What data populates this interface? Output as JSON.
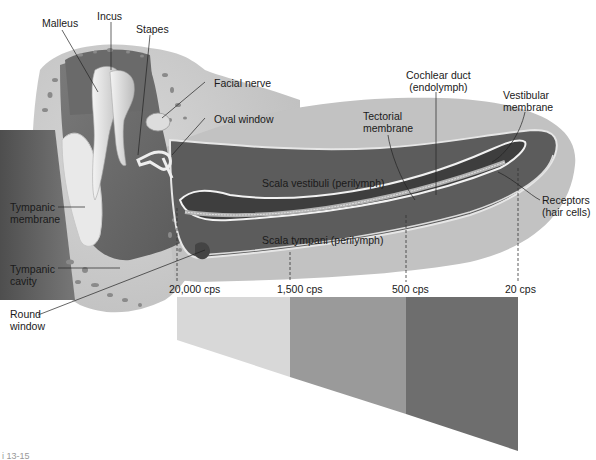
{
  "figure": {
    "caption_fragment": "i 13-15"
  },
  "labels": {
    "malleus": "Malleus",
    "incus": "Incus",
    "stapes": "Stapes",
    "facial_nerve": "Facial nerve",
    "oval_window": "Oval window",
    "cochlear_duct_1": "Cochlear duct",
    "cochlear_duct_2": "(endolymph)",
    "tectorial_1": "Tectorial",
    "tectorial_2": "membrane",
    "vestibular_1": "Vestibular",
    "vestibular_2": "membrane",
    "receptors_1": "Receptors",
    "receptors_2": "(hair cells)",
    "tympanic_membrane_1": "Tympanic",
    "tympanic_membrane_2": "membrane",
    "tympanic_cavity_1": "Tympanic",
    "tympanic_cavity_2": "cavity",
    "round_window_1": "Round",
    "round_window_2": "window",
    "scala_vestibuli": "Scala vestibuli (perilymph)",
    "scala_tympani": "Scala tympani (perilymph)"
  },
  "frequencies": [
    {
      "label": "20,000 cps",
      "x": 177
    },
    {
      "label": "1,500 cps",
      "x": 290
    },
    {
      "label": "500 cps",
      "x": 406
    },
    {
      "label": "20 cps",
      "x": 518
    }
  ],
  "frequency_bands": [
    {
      "from": "20,000 cps",
      "to": "1,500 cps",
      "color": "#d8d8d8"
    },
    {
      "from": "1,500 cps",
      "to": "500 cps",
      "color": "#9a9a9a"
    },
    {
      "from": "500 cps",
      "to": "20 cps",
      "color": "#6e6e6e"
    }
  ],
  "colors": {
    "bone": "#cfcfcf",
    "cavity": "#6f6f6f",
    "scala": "#5e5e5e",
    "duct": "#3e3e3e",
    "membrane_line": "#f2f2f2",
    "leader": "#222222"
  }
}
